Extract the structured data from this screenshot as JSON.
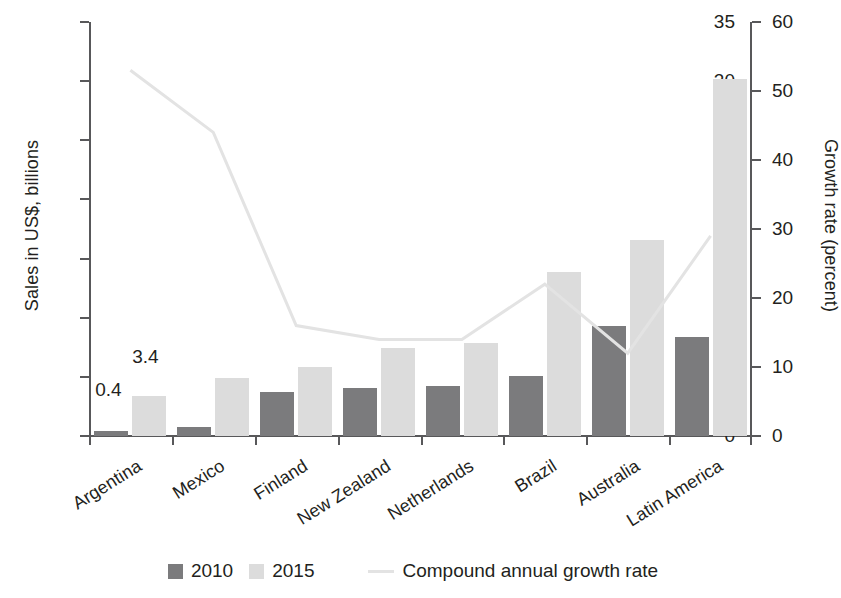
{
  "chart_data": {
    "type": "bar",
    "title": "",
    "subtitle": "",
    "categories": [
      "Argentina",
      "Mexico",
      "Finland",
      "New Zealand",
      "Netherlands",
      "Brazil",
      "Australia",
      "Latin America"
    ],
    "series": [
      {
        "name": "2010",
        "axis": "left",
        "values": [
          0.4,
          0.8,
          3.7,
          4.1,
          4.2,
          5.1,
          9.3,
          8.4
        ]
      },
      {
        "name": "2015",
        "axis": "left",
        "values": [
          3.4,
          4.9,
          5.8,
          7.4,
          7.9,
          13.9,
          16.6,
          30.2
        ]
      },
      {
        "name": "Compound annual growth rate",
        "axis": "right",
        "type": "line",
        "values": [
          53,
          44,
          16,
          14,
          14,
          22,
          12,
          29
        ]
      }
    ],
    "point_labels": {
      "0": {
        "2010": "0.4",
        "2015": "3.4"
      }
    },
    "xlabel": "",
    "ylabel": "Sales in US$, billions",
    "y2label": "Growth rate (percent)",
    "ylim": [
      0,
      35
    ],
    "y2lim": [
      0,
      60
    ],
    "yticks": [
      "0",
      "5",
      "10",
      "15",
      "20",
      "25",
      "30",
      "35"
    ],
    "y2ticks": [
      "0",
      "10",
      "20",
      "30",
      "40",
      "50",
      "60"
    ],
    "grid": false,
    "legend_position": "bottom"
  },
  "axes": {
    "left_title": "Sales in US$, billions",
    "right_title": "Growth rate (percent)",
    "left_ticks": [
      "35",
      "30",
      "25",
      "20",
      "15",
      "10",
      "5",
      "0"
    ],
    "right_ticks": [
      "60",
      "50",
      "40",
      "30",
      "20",
      "10",
      "0"
    ]
  },
  "legend": {
    "items": [
      {
        "label": "2010",
        "marker": "dark-square-swatch",
        "color": "#7b7b7d"
      },
      {
        "label": "2015",
        "marker": "light-square-swatch",
        "color": "#dcdcdc"
      },
      {
        "label": "Compound annual growth rate",
        "marker": "light-line-swatch",
        "color": "#e3e3e3"
      }
    ]
  },
  "annotations": [
    {
      "text": "0.4",
      "for": "Argentina 2010"
    },
    {
      "text": "3.4",
      "for": "Argentina 2015"
    }
  ],
  "colors": {
    "bar_2010": "#7b7b7d",
    "bar_2015": "#dcdcdc",
    "cagr_line": "#e3e3e3",
    "axis": "#58585a",
    "text": "#231f20",
    "background": "#ffffff"
  }
}
